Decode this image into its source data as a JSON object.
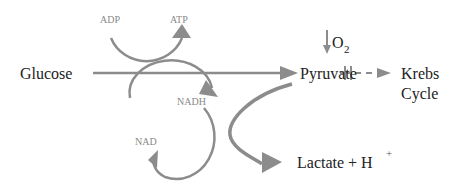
{
  "diagram": {
    "nodes": {
      "glucose": "Glucose",
      "pyruvate": "Pyruvate",
      "krebs_line1": "Krebs",
      "krebs_line2": "Cycle",
      "lactate": "Lactate + H",
      "lactate_sup": "+",
      "adp": "ADP",
      "atp": "ATP",
      "nadh": "NADH",
      "nad": "NAD",
      "oxygen": "O",
      "oxygen_sub": "2"
    },
    "edges": [
      {
        "from": "glucose",
        "to": "pyruvate",
        "style": "solid"
      },
      {
        "from": "adp",
        "to": "atp",
        "style": "curved"
      },
      {
        "from": "nad",
        "to": "nadh",
        "style": "curved"
      },
      {
        "from": "nadh",
        "to": "nad",
        "style": "curved"
      },
      {
        "from": "pyruvate",
        "to": "lactate",
        "style": "curved"
      },
      {
        "from": "pyruvate",
        "to": "krebs",
        "style": "dashed-blocked"
      }
    ],
    "colors": {
      "arrow": "#8c8c8c",
      "text": "#222222",
      "cofactor_text": "#8a8a8a"
    }
  }
}
